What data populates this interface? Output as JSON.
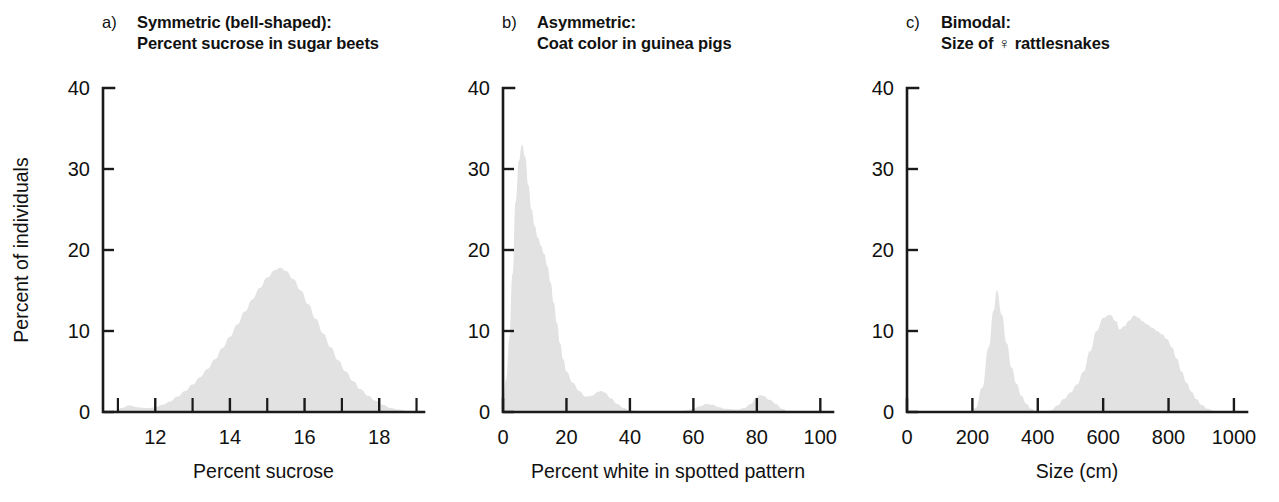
{
  "figure": {
    "background": "#ffffff",
    "ink_color": "#111111",
    "fill_color": "#e2e2e2"
  },
  "panels": [
    {
      "letter": "a)",
      "title_line1": "Symmetric (bell-shaped):",
      "title_line2": "Percent sucrose in sugar beets"
    },
    {
      "letter": "b)",
      "title_line1": "Asymmetric:",
      "title_line2": "Coat color in guinea pigs"
    },
    {
      "letter": "c)",
      "title_line1": "Bimodal:",
      "title_line2": "Size of ♀ rattlesnakes"
    }
  ],
  "shared": {
    "ylabel": "Percent of individuals",
    "y_ticks": [
      "0",
      "10",
      "20",
      "30",
      "40"
    ],
    "y_values": [
      0,
      10,
      20,
      30,
      40
    ],
    "ylim": [
      0,
      40
    ]
  },
  "chart_data": [
    {
      "type": "area",
      "panel": "a",
      "title": "Symmetric (bell-shaped): Percent sucrose in sugar beets",
      "xlabel": "Percent sucrose",
      "ylabel": "Percent of individuals",
      "xlim": [
        10.6,
        19.2
      ],
      "ylim": [
        0,
        40
      ],
      "x_ticks_major": [
        12,
        14,
        16,
        18
      ],
      "x_ticks_major_labels": [
        "12",
        "14",
        "16",
        "18"
      ],
      "x_ticks_minor": [
        11,
        13,
        15,
        17,
        19
      ],
      "grid": false,
      "legend": "none",
      "x": [
        10.6,
        10.9,
        11.1,
        11.3,
        11.5,
        11.8,
        12.0,
        12.2,
        12.4,
        12.6,
        12.8,
        13.0,
        13.2,
        13.4,
        13.6,
        13.8,
        14.0,
        14.2,
        14.4,
        14.6,
        14.8,
        15.0,
        15.2,
        15.35,
        15.5,
        15.7,
        15.9,
        16.1,
        16.3,
        16.5,
        16.7,
        16.9,
        17.1,
        17.3,
        17.5,
        17.7,
        17.9,
        18.1,
        18.3,
        18.5,
        18.8,
        19.2
      ],
      "values": [
        0.0,
        0.2,
        0.5,
        0.8,
        0.6,
        0.5,
        0.6,
        0.9,
        1.3,
        1.9,
        2.6,
        3.4,
        4.3,
        5.3,
        6.5,
        7.9,
        9.3,
        10.8,
        12.4,
        13.9,
        15.3,
        16.6,
        17.5,
        17.8,
        17.4,
        16.4,
        15.0,
        13.3,
        11.5,
        9.7,
        8.0,
        6.4,
        5.0,
        3.8,
        2.8,
        2.0,
        1.4,
        0.9,
        0.5,
        0.3,
        0.1,
        0.0
      ]
    },
    {
      "type": "area",
      "panel": "b",
      "title": "Asymmetric: Coat color in guinea pigs",
      "xlabel": "Percent white in spotted pattern",
      "ylabel": "Percent of individuals",
      "xlim": [
        0,
        104
      ],
      "ylim": [
        0,
        40
      ],
      "x_ticks_major": [
        0,
        20,
        40,
        60,
        80,
        100
      ],
      "x_ticks_major_labels": [
        "0",
        "20",
        "40",
        "60",
        "80",
        "100"
      ],
      "x_ticks_minor": [],
      "grid": false,
      "legend": "none",
      "x": [
        0,
        1,
        2,
        3,
        4,
        5,
        6,
        7,
        8,
        9,
        10,
        11,
        12,
        13,
        14,
        15,
        16,
        17,
        18,
        19,
        20,
        22,
        24,
        26,
        28,
        30,
        31,
        32,
        34,
        36,
        38,
        40,
        45,
        50,
        55,
        58,
        60,
        62,
        64,
        66,
        68,
        70,
        74,
        76,
        78,
        80,
        81,
        82,
        84,
        86,
        88,
        90
      ],
      "values": [
        1.8,
        4.0,
        9.0,
        17.0,
        26.0,
        31.0,
        33.0,
        31.5,
        28.0,
        25.0,
        23.0,
        21.5,
        20.5,
        19.5,
        18.0,
        16.0,
        13.5,
        11.0,
        8.5,
        6.5,
        5.0,
        3.6,
        2.6,
        1.9,
        2.0,
        2.5,
        2.6,
        2.4,
        1.7,
        1.0,
        0.5,
        0.2,
        0.05,
        0.05,
        0.1,
        0.2,
        0.4,
        0.7,
        1.0,
        0.9,
        0.6,
        0.4,
        0.3,
        0.5,
        1.0,
        1.8,
        2.1,
        2.0,
        1.5,
        1.0,
        0.4,
        0.0
      ]
    },
    {
      "type": "area",
      "panel": "c",
      "title": "Bimodal: Size of ♀ rattlesnakes",
      "xlabel": "Size (cm)",
      "ylabel": "Percent of individuals",
      "xlim": [
        0,
        1040
      ],
      "ylim": [
        0,
        40
      ],
      "x_ticks_major": [
        0,
        200,
        400,
        600,
        800,
        1000
      ],
      "x_ticks_major_labels": [
        "0",
        "200",
        "400",
        "600",
        "800",
        "1000"
      ],
      "x_ticks_minor": [],
      "grid": false,
      "legend": "none",
      "x": [
        0,
        150,
        190,
        210,
        230,
        250,
        265,
        275,
        290,
        305,
        320,
        335,
        350,
        365,
        380,
        395,
        410,
        425,
        440,
        460,
        480,
        500,
        520,
        540,
        560,
        580,
        600,
        620,
        640,
        650,
        665,
        680,
        695,
        710,
        720,
        735,
        750,
        765,
        780,
        795,
        810,
        825,
        840,
        855,
        870,
        885,
        900,
        920,
        940,
        1000,
        1040
      ],
      "values": [
        0.0,
        0.0,
        0.1,
        0.5,
        3.0,
        8.0,
        12.5,
        15.0,
        12.0,
        8.5,
        5.5,
        3.5,
        2.0,
        1.0,
        0.4,
        0.1,
        0.0,
        0.0,
        0.2,
        0.8,
        1.6,
        2.4,
        3.4,
        5.0,
        7.5,
        10.0,
        11.6,
        12.0,
        11.2,
        10.2,
        10.6,
        11.3,
        11.9,
        11.6,
        11.2,
        10.8,
        10.4,
        10.0,
        9.6,
        9.0,
        8.0,
        6.6,
        5.0,
        3.6,
        2.5,
        1.6,
        0.9,
        0.4,
        0.1,
        0.0,
        0.0
      ]
    }
  ]
}
